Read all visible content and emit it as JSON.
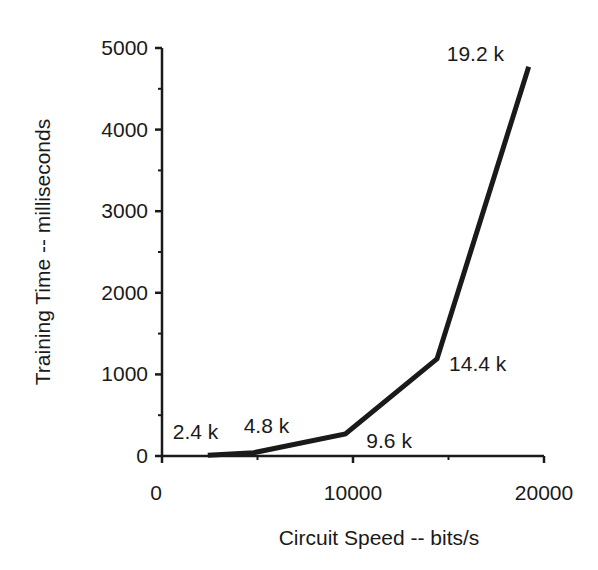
{
  "chart_data": {
    "type": "line",
    "title": "",
    "xlabel": "Circuit Speed -- bits/s",
    "ylabel": "Training Time -- milliseconds",
    "xlim": [
      0,
      20000
    ],
    "ylim": [
      0,
      5000
    ],
    "x_ticks": [
      "0",
      "10000",
      "20000"
    ],
    "x_tick_values": [
      0,
      10000,
      20000
    ],
    "x_minor_ticks": [
      5000,
      15000
    ],
    "y_ticks": [
      "0",
      "1000",
      "2000",
      "3000",
      "4000",
      "5000"
    ],
    "y_tick_values": [
      0,
      1000,
      2000,
      3000,
      4000,
      5000
    ],
    "y_minor_ticks": [
      500,
      1500,
      2500,
      3500,
      4500
    ],
    "grid": false,
    "legend": null,
    "series": [
      {
        "name": "Training Time",
        "color": "#1a1a1a",
        "x": [
          2400,
          4800,
          9600,
          14400,
          19200
        ],
        "values": [
          10,
          40,
          270,
          1190,
          4770
        ]
      }
    ],
    "annotations": [
      {
        "text": "2.4 k",
        "x": 2400,
        "y": 10
      },
      {
        "text": "4.8 k",
        "x": 4800,
        "y": 40
      },
      {
        "text": "9.6 k",
        "x": 9600,
        "y": 270
      },
      {
        "text": "14.4 k",
        "x": 14400,
        "y": 1190
      },
      {
        "text": "19.2 k",
        "x": 19200,
        "y": 4770
      }
    ]
  }
}
